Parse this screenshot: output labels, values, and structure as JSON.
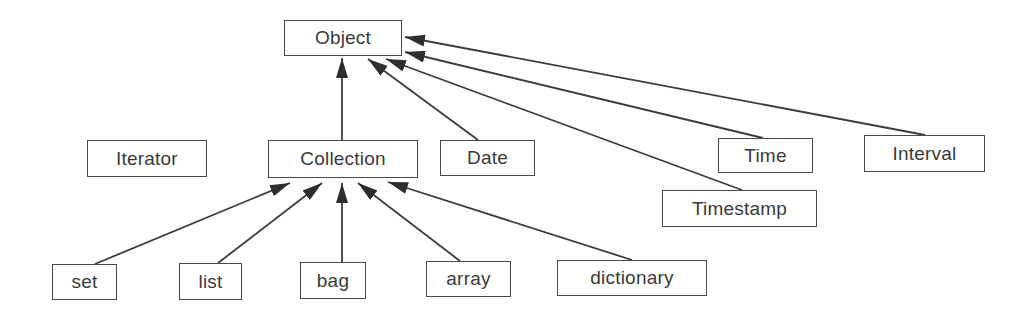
{
  "diagram": {
    "type": "class-hierarchy",
    "nodes": [
      {
        "id": "object",
        "label": "Object",
        "x": 284,
        "y": 20,
        "w": 118,
        "h": 36
      },
      {
        "id": "iterator",
        "label": "Iterator",
        "x": 87,
        "y": 140,
        "w": 120,
        "h": 37
      },
      {
        "id": "collection",
        "label": "Collection",
        "x": 268,
        "y": 140,
        "w": 150,
        "h": 38
      },
      {
        "id": "date",
        "label": "Date",
        "x": 440,
        "y": 140,
        "w": 95,
        "h": 36
      },
      {
        "id": "time",
        "label": "Time",
        "x": 718,
        "y": 138,
        "w": 95,
        "h": 35
      },
      {
        "id": "interval",
        "label": "Interval",
        "x": 864,
        "y": 135,
        "w": 121,
        "h": 37
      },
      {
        "id": "timestamp",
        "label": "Timestamp",
        "x": 662,
        "y": 190,
        "w": 155,
        "h": 37
      },
      {
        "id": "set",
        "label": "set",
        "x": 52,
        "y": 264,
        "w": 65,
        "h": 36
      },
      {
        "id": "list",
        "label": "list",
        "x": 179,
        "y": 263,
        "w": 63,
        "h": 37
      },
      {
        "id": "bag",
        "label": "bag",
        "x": 300,
        "y": 262,
        "w": 66,
        "h": 37
      },
      {
        "id": "array",
        "label": "array",
        "x": 426,
        "y": 261,
        "w": 85,
        "h": 36
      },
      {
        "id": "dictionary",
        "label": "dictionary",
        "x": 557,
        "y": 260,
        "w": 150,
        "h": 36
      }
    ],
    "edges": [
      {
        "from": "collection",
        "to": "object",
        "x1": 342,
        "y1": 140,
        "x2": 342,
        "y2": 58
      },
      {
        "from": "date",
        "to": "object",
        "x1": 478,
        "y1": 140,
        "x2": 368,
        "y2": 59
      },
      {
        "from": "timestamp",
        "to": "object",
        "x1": 742,
        "y1": 190,
        "x2": 386,
        "y2": 59
      },
      {
        "from": "time",
        "to": "object",
        "x1": 763,
        "y1": 138,
        "x2": 405,
        "y2": 52
      },
      {
        "from": "interval",
        "to": "object",
        "x1": 925,
        "y1": 135,
        "x2": 405,
        "y2": 37
      },
      {
        "from": "set",
        "to": "collection",
        "x1": 95,
        "y1": 264,
        "x2": 290,
        "y2": 183
      },
      {
        "from": "list",
        "to": "collection",
        "x1": 218,
        "y1": 263,
        "x2": 322,
        "y2": 183
      },
      {
        "from": "bag",
        "to": "collection",
        "x1": 342,
        "y1": 262,
        "x2": 342,
        "y2": 183
      },
      {
        "from": "array",
        "to": "collection",
        "x1": 460,
        "y1": 261,
        "x2": 358,
        "y2": 183
      },
      {
        "from": "dictionary",
        "to": "collection",
        "x1": 632,
        "y1": 260,
        "x2": 388,
        "y2": 182
      }
    ]
  },
  "colors": {
    "stroke": "#3c3c3c",
    "text": "#3a3a3a",
    "background": "#ffffff"
  }
}
